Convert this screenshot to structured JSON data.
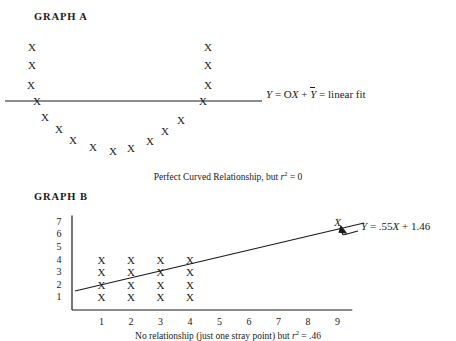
{
  "figure": {
    "top_cut_text": "",
    "graph_a": {
      "title": "GRAPH A",
      "caption_prefix": "Perfect Curved Relationship, but ",
      "caption_r": "r",
      "caption_sup": "2",
      "caption_suffix": " = 0",
      "equation_y1": "Y",
      "equation_mid": " = O",
      "equation_x": "X",
      "equation_plus": " + ",
      "equation_ybar": "Y",
      "equation_tail": " = linear fit",
      "line": {
        "x1": 5,
        "y1": 101,
        "x2": 262,
        "y2": 101,
        "color": "#1a1a1a"
      },
      "marks_label": "X",
      "marks_left_column": [
        {
          "x": 32,
          "y": 47
        },
        {
          "x": 32,
          "y": 65
        },
        {
          "x": 31,
          "y": 85
        },
        {
          "x": 37,
          "y": 101
        }
      ],
      "marks_right_column": [
        {
          "x": 208,
          "y": 47
        },
        {
          "x": 208,
          "y": 65
        },
        {
          "x": 208,
          "y": 85
        },
        {
          "x": 203,
          "y": 101
        }
      ],
      "marks_curve": [
        {
          "x": 45,
          "y": 117
        },
        {
          "x": 59,
          "y": 129
        },
        {
          "x": 73,
          "y": 140
        },
        {
          "x": 93,
          "y": 147
        },
        {
          "x": 113,
          "y": 151
        },
        {
          "x": 131,
          "y": 148
        },
        {
          "x": 150,
          "y": 141
        },
        {
          "x": 165,
          "y": 131
        },
        {
          "x": 181,
          "y": 120
        }
      ]
    },
    "graph_b": {
      "title": "GRAPH B",
      "caption_prefix": "No relationship (just one stray point) but ",
      "caption_r": "r",
      "caption_sup": "2",
      "caption_suffix": " = .46",
      "equation_y": "Y",
      "equation_rest": " = .55",
      "equation_x": "X",
      "equation_tail": " + 1.46",
      "y_axis_ticks": [
        "7",
        "6",
        "5",
        "4",
        "3",
        "2",
        "1"
      ],
      "x_axis_ticks": [
        "1",
        "2",
        "3",
        "4",
        "5",
        "6",
        "7",
        "8",
        "9"
      ],
      "marks_label": "X",
      "grid_points": [
        {
          "x": 1,
          "y": 1
        },
        {
          "x": 1,
          "y": 2
        },
        {
          "x": 1,
          "y": 3
        },
        {
          "x": 1,
          "y": 4
        },
        {
          "x": 2,
          "y": 1
        },
        {
          "x": 2,
          "y": 2
        },
        {
          "x": 2,
          "y": 3
        },
        {
          "x": 2,
          "y": 4
        },
        {
          "x": 3,
          "y": 1
        },
        {
          "x": 3,
          "y": 2
        },
        {
          "x": 3,
          "y": 3
        },
        {
          "x": 3,
          "y": 4
        },
        {
          "x": 4,
          "y": 1
        },
        {
          "x": 4,
          "y": 2
        },
        {
          "x": 4,
          "y": 3
        },
        {
          "x": 4,
          "y": 4
        }
      ],
      "stray_point": {
        "x": 9,
        "y": 7
      },
      "regression_slope": 0.55,
      "regression_intercept": 1.46,
      "axis_color": "#1a1a1a",
      "line_color": "#1a1a1a"
    }
  },
  "chart_data": [
    {
      "type": "scatter",
      "title": "GRAPH A",
      "subtitle": "Perfect Curved Relationship, but r2 = 0",
      "xlabel": "",
      "ylabel": "",
      "annotations": [
        "Y = OX + Ybar = linear fit"
      ],
      "series": [
        {
          "name": "observations",
          "marker": "X",
          "points_px": [
            [
              32,
              47
            ],
            [
              32,
              65
            ],
            [
              31,
              85
            ],
            [
              37,
              101
            ],
            [
              45,
              117
            ],
            [
              59,
              129
            ],
            [
              73,
              140
            ],
            [
              93,
              147
            ],
            [
              113,
              151
            ],
            [
              131,
              148
            ],
            [
              150,
              141
            ],
            [
              165,
              131
            ],
            [
              181,
              120
            ],
            [
              203,
              101
            ],
            [
              208,
              85
            ],
            [
              208,
              65
            ],
            [
              208,
              47
            ]
          ]
        }
      ],
      "fit_line": {
        "slope": 0,
        "intercept_label": "Ybar",
        "r_squared": 0
      },
      "grid": false,
      "legend": "none"
    },
    {
      "type": "scatter",
      "title": "GRAPH B",
      "subtitle": "No relationship (just one stray point) but r2 = .46",
      "xlabel": "",
      "ylabel": "",
      "xlim": [
        0,
        9.6
      ],
      "ylim": [
        0,
        7.6
      ],
      "xticks": [
        1,
        2,
        3,
        4,
        5,
        6,
        7,
        8,
        9
      ],
      "yticks": [
        1,
        2,
        3,
        4,
        5,
        6,
        7
      ],
      "annotations": [
        "Y = .55X + 1.46"
      ],
      "series": [
        {
          "name": "cluster",
          "marker": "X",
          "x": [
            1,
            1,
            1,
            1,
            2,
            2,
            2,
            2,
            3,
            3,
            3,
            3,
            4,
            4,
            4,
            4
          ],
          "y": [
            1,
            2,
            3,
            4,
            1,
            2,
            3,
            4,
            1,
            2,
            3,
            4,
            1,
            2,
            3,
            4
          ]
        },
        {
          "name": "stray-point",
          "marker": "X",
          "x": [
            9
          ],
          "y": [
            7
          ]
        }
      ],
      "fit_line": {
        "slope": 0.55,
        "intercept": 1.46,
        "r_squared": 0.46
      },
      "grid": false,
      "legend": "none"
    }
  ]
}
